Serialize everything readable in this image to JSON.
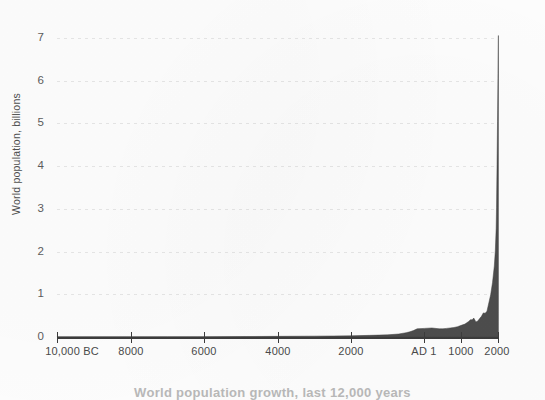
{
  "chart_data": {
    "type": "area",
    "title": "",
    "subtitle": "",
    "xlabel": "",
    "ylabel": "World population, billions",
    "caption": "World population growth, last 12,000 years",
    "grid": true,
    "legend_position": "none",
    "xlim": [
      -10000,
      2000
    ],
    "ylim": [
      0,
      7.5
    ],
    "x_tick_values": [
      -10000,
      -8000,
      -6000,
      -4000,
      -2000,
      1,
      1000,
      2000
    ],
    "x_tick_labels": [
      "10,000 BC",
      "8000",
      "6000",
      "4000",
      "2000",
      "AD 1",
      "1000",
      "2000"
    ],
    "y_tick_values": [
      0,
      1,
      2,
      3,
      4,
      5,
      6,
      7
    ],
    "y_tick_labels": [
      "0",
      "1",
      "2",
      "3",
      "4",
      "5",
      "6",
      "7"
    ],
    "series": [
      {
        "name": "World population",
        "units": "billions",
        "fill_color": "#4d4d4d",
        "x": [
          -10000,
          -9000,
          -8000,
          -7000,
          -6000,
          -5000,
          -4000,
          -3000,
          -2000,
          -1500,
          -1000,
          -700,
          -500,
          -400,
          -300,
          -200,
          1,
          200,
          400,
          500,
          600,
          700,
          800,
          900,
          1000,
          1100,
          1200,
          1250,
          1300,
          1340,
          1400,
          1450,
          1500,
          1550,
          1600,
          1650,
          1700,
          1750,
          1800,
          1850,
          1900,
          1927,
          1950,
          1960,
          1974,
          1987,
          1999,
          2000,
          2011
        ],
        "y": [
          0.004,
          0.005,
          0.005,
          0.006,
          0.007,
          0.01,
          0.015,
          0.02,
          0.027,
          0.038,
          0.05,
          0.07,
          0.1,
          0.12,
          0.15,
          0.19,
          0.2,
          0.21,
          0.19,
          0.19,
          0.2,
          0.21,
          0.22,
          0.24,
          0.27,
          0.3,
          0.36,
          0.4,
          0.4,
          0.44,
          0.35,
          0.37,
          0.43,
          0.48,
          0.56,
          0.55,
          0.6,
          0.79,
          0.98,
          1.26,
          1.65,
          2.0,
          2.52,
          3.0,
          4.0,
          5.0,
          6.0,
          6.12,
          7.0
        ]
      }
    ]
  },
  "axes": {
    "y_title": "World population, billions",
    "y_ticks": [
      "7",
      "6",
      "5",
      "4",
      "3",
      "2",
      "1",
      "0"
    ],
    "x_ticks": [
      "10,000 BC",
      "8000",
      "6000",
      "4000",
      "2000",
      "AD 1",
      "1000",
      "2000"
    ]
  },
  "figure": {
    "caption": "World population growth, last 12,000 years",
    "background_color": "#fdfdfd",
    "series_color": "#4d4d4d",
    "gridline_color": "#e2e2e2",
    "axis_color": "#3c3c3c",
    "text_color": "#4a4a4a"
  }
}
